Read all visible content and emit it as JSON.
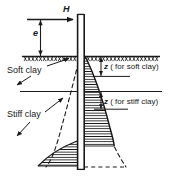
{
  "figure": {
    "name": "laterally-loaded-pile-in-layered-clay",
    "labels": {
      "lateral_load": "H",
      "eccentricity": "e",
      "upper_layer": "Soft clay",
      "lower_layer": "Stiff clay",
      "depth_soft": "z",
      "depth_soft_note": "( for soft clay)",
      "depth_stiff": "z",
      "depth_stiff_note": "( for stiff clay)"
    },
    "colors": {
      "ink": "#1a1a1a",
      "line": "#222222",
      "background": "#ffffff"
    },
    "elements": {
      "pile": "vertical-pile",
      "ground_surface": "ground-surface-hatched",
      "layer_boundary": "soft-stiff-clay-interface",
      "pressure_diagram_right": "soil-reaction-hatched-right",
      "pressure_diagram_left": "soil-reaction-hatched-left",
      "deflected_shape": "dashed-deflection-curve"
    }
  }
}
